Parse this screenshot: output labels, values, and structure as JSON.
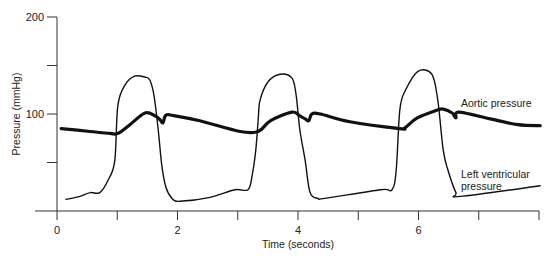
{
  "chart_data": {
    "type": "line",
    "title": "",
    "xlabel": "Time (seconds)",
    "ylabel": "Pressure (mmHg)",
    "xlim": [
      0,
      8
    ],
    "ylim": [
      0,
      200
    ],
    "grid": false,
    "legend": "inline labels at right",
    "x_ticks": [
      0,
      1,
      2,
      3,
      4,
      5,
      6,
      7,
      8
    ],
    "x_tick_labels": [
      "0",
      "",
      "2",
      "",
      "4",
      "",
      "6",
      "",
      ""
    ],
    "y_ticks": [
      0,
      50,
      100,
      150,
      200
    ],
    "y_tick_labels": [
      "",
      "",
      "100",
      "",
      "200"
    ],
    "series": [
      {
        "name": "Aortic pressure",
        "label_lines": [
          "Aortic pressure"
        ],
        "stroke_width": 3.2,
        "color": "#111111",
        "points": [
          [
            0.07,
            85
          ],
          [
            0.55,
            82
          ],
          [
            0.88,
            80
          ],
          [
            1.01,
            80
          ],
          [
            1.21,
            89
          ],
          [
            1.46,
            101
          ],
          [
            1.63,
            98
          ],
          [
            1.71,
            94
          ],
          [
            1.76,
            91
          ],
          [
            1.81,
            99
          ],
          [
            1.96,
            98
          ],
          [
            2.37,
            93
          ],
          [
            3.04,
            82
          ],
          [
            3.34,
            82
          ],
          [
            3.54,
            93
          ],
          [
            3.9,
            102
          ],
          [
            4.03,
            98
          ],
          [
            4.12,
            95
          ],
          [
            4.18,
            93
          ],
          [
            4.23,
            100
          ],
          [
            4.37,
            100
          ],
          [
            4.86,
            92
          ],
          [
            5.69,
            85
          ],
          [
            5.78,
            86
          ],
          [
            5.98,
            96
          ],
          [
            6.31,
            104
          ],
          [
            6.41,
            105
          ],
          [
            6.56,
            101
          ],
          [
            6.62,
            96
          ],
          [
            6.67,
            102
          ],
          [
            7.19,
            95
          ],
          [
            7.65,
            89
          ],
          [
            8.02,
            88
          ]
        ]
      },
      {
        "name": "Left ventricular pressure",
        "label_lines": [
          "Left ventricular",
          "pressure"
        ],
        "stroke_width": 1.4,
        "color": "#111111",
        "points": [
          [
            0.15,
            12
          ],
          [
            0.38,
            15
          ],
          [
            0.55,
            19
          ],
          [
            0.71,
            19
          ],
          [
            0.85,
            32
          ],
          [
            0.96,
            52
          ],
          [
            1.01,
            109
          ],
          [
            1.13,
            130
          ],
          [
            1.29,
            139
          ],
          [
            1.46,
            138
          ],
          [
            1.54,
            135
          ],
          [
            1.61,
            119
          ],
          [
            1.68,
            84
          ],
          [
            1.74,
            47
          ],
          [
            1.81,
            24
          ],
          [
            1.91,
            13
          ],
          [
            2.04,
            10
          ],
          [
            2.54,
            14
          ],
          [
            2.95,
            22
          ],
          [
            3.17,
            22
          ],
          [
            3.24,
            37
          ],
          [
            3.3,
            63
          ],
          [
            3.34,
            94
          ],
          [
            3.37,
            114
          ],
          [
            3.5,
            133
          ],
          [
            3.7,
            141
          ],
          [
            3.9,
            137
          ],
          [
            3.97,
            119
          ],
          [
            4.03,
            84
          ],
          [
            4.12,
            52
          ],
          [
            4.2,
            19
          ],
          [
            4.33,
            13
          ],
          [
            4.45,
            13
          ],
          [
            5.37,
            22
          ],
          [
            5.56,
            22
          ],
          [
            5.63,
            42
          ],
          [
            5.69,
            104
          ],
          [
            5.78,
            124
          ],
          [
            5.99,
            144
          ],
          [
            6.22,
            141
          ],
          [
            6.32,
            114
          ],
          [
            6.41,
            63
          ],
          [
            6.49,
            42
          ],
          [
            6.62,
            19
          ],
          [
            6.69,
            15
          ],
          [
            8.02,
            26
          ]
        ]
      }
    ]
  }
}
